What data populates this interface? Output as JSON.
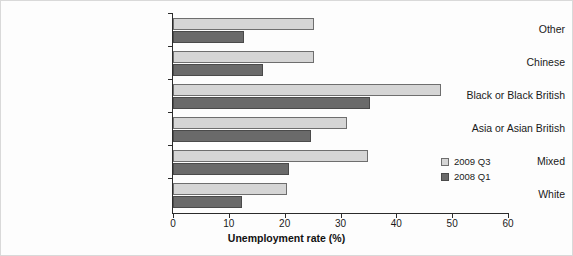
{
  "chart_data": {
    "type": "bar",
    "orientation": "horizontal",
    "title": "",
    "xlabel": "Unemployment rate (%)",
    "ylabel": "",
    "xlim": [
      0,
      60
    ],
    "xticks": [
      0,
      10,
      20,
      30,
      40,
      50,
      60
    ],
    "grid": false,
    "legend_position": "right",
    "categories": [
      "Other",
      "Chinese",
      "Black or Black British",
      "Asia or Asian British",
      "Mixed",
      "White"
    ],
    "series": [
      {
        "name": "2009 Q3",
        "color": "#d5d5d5",
        "values": [
          25.3,
          25.3,
          48.0,
          31.2,
          35.0,
          20.5
        ]
      },
      {
        "name": "2008 Q1",
        "color": "#6a6a6a",
        "values": [
          12.7,
          16.1,
          35.3,
          24.7,
          20.8,
          12.3
        ]
      }
    ]
  },
  "legend": {
    "entries": [
      {
        "label": "2009 Q3"
      },
      {
        "label": "2008 Q1"
      }
    ]
  }
}
